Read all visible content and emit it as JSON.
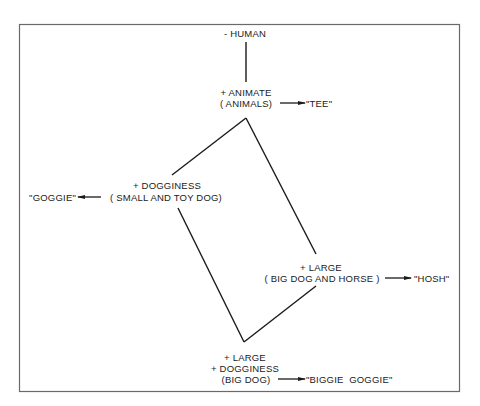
{
  "diagram": {
    "type": "semantic feature hierarchy",
    "frame": {
      "x": 19,
      "y": 24,
      "width": 441,
      "height": 368,
      "stroke": "#6a6a6a"
    },
    "line_color": "#1a1a1a",
    "nodes": [
      {
        "id": "human",
        "lines": [
          "- HUMAN"
        ]
      },
      {
        "id": "animate",
        "lines": [
          "+ ANIMATE",
          "( ANIMALS)"
        ],
        "word": "\"TEE\""
      },
      {
        "id": "dogginess",
        "lines": [
          "+ DOGGINESS",
          "( SMALL AND TOY DOG)"
        ],
        "word": "\"GOGGIE\""
      },
      {
        "id": "large",
        "lines": [
          "+ LARGE",
          "( BIG  DOG AND HORSE )"
        ],
        "word": "\"HOSH\""
      },
      {
        "id": "large-dogginess",
        "lines": [
          "+ LARGE",
          "+ DOGGINESS",
          "(BIG DOG)"
        ],
        "word": "\"BIGGIE  GOGGIE\""
      }
    ],
    "edges": [
      {
        "from": "human",
        "to": "animate"
      },
      {
        "from": "animate",
        "to": "dogginess"
      },
      {
        "from": "animate",
        "to": "large"
      },
      {
        "from": "dogginess",
        "to": "large-dogginess"
      },
      {
        "from": "large",
        "to": "large-dogginess"
      }
    ]
  }
}
